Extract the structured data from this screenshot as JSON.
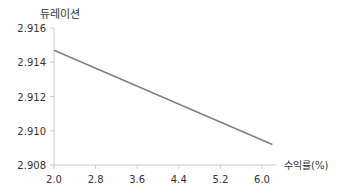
{
  "chart_data": {
    "type": "line",
    "title": "",
    "xlabel": "수익률(%)",
    "ylabel": "듀레이션",
    "x_ticks": [
      "2.0",
      "2.8",
      "3.6",
      "4.4",
      "5.2",
      "6.0"
    ],
    "y_ticks": [
      "2.908",
      "2.910",
      "2.912",
      "2.914",
      "2.916"
    ],
    "xlim": [
      2.0,
      6.2
    ],
    "ylim": [
      2.908,
      2.916
    ],
    "grid": false,
    "legend": null,
    "series": [
      {
        "name": "듀레이션",
        "color": "#808080",
        "x": [
          2.0,
          6.2
        ],
        "y": [
          2.9147,
          2.9092
        ]
      }
    ]
  }
}
